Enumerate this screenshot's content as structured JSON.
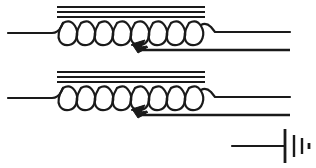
{
  "diagram": {
    "background_color": "#ffffff",
    "ink_color": "#1a1a1a",
    "width": 316,
    "height": 168,
    "components": [
      {
        "id": "inductor-1",
        "name": "tapped-iron-core-inductor-upper",
        "symbol": "inductor-with-core-and-wiper-tap",
        "loop_count": 8,
        "core_line_count": 3,
        "core": {
          "x1": 57,
          "x2": 205,
          "y_lines": [
            7,
            12,
            17
          ]
        },
        "coil": {
          "x_start": 60,
          "x_end": 205,
          "y_top": 22,
          "y_bottom": 45,
          "loops": 8
        },
        "lead_left": {
          "x1": 8,
          "y1": 33,
          "x2": 60,
          "y2": 22
        },
        "lead_right": {
          "x1": 205,
          "y1": 27,
          "x2": 290,
          "y2": 33
        },
        "tap": {
          "arrow_x": 140,
          "arrow_y": 45,
          "wire_x1": 140,
          "wire_y1": 50,
          "wire_x2": 290,
          "wire_y2": 50
        }
      },
      {
        "id": "inductor-2",
        "name": "tapped-iron-core-inductor-lower",
        "symbol": "inductor-with-core-and-wiper-tap",
        "loop_count": 8,
        "core_line_count": 3,
        "core": {
          "x1": 57,
          "x2": 205,
          "y_lines": [
            72,
            77,
            82
          ]
        },
        "coil": {
          "x_start": 60,
          "x_end": 205,
          "y_top": 87,
          "y_bottom": 110,
          "loops": 8
        },
        "lead_left": {
          "x1": 8,
          "y1": 98,
          "x2": 60,
          "y2": 87
        },
        "lead_right": {
          "x1": 205,
          "y1": 92,
          "x2": 290,
          "y2": 98
        },
        "tap": {
          "arrow_x": 140,
          "arrow_y": 110,
          "wire_x1": 140,
          "wire_y1": 115,
          "wire_x2": 290,
          "wire_y2": 115
        }
      },
      {
        "id": "battery-1",
        "name": "battery-cell-source",
        "symbol": "battery",
        "lead_left": {
          "x1": 232,
          "y1": 146,
          "x2": 285,
          "y2": 146
        },
        "plates": [
          {
            "x": 285,
            "half_height": 17,
            "thickness": 2.8
          },
          {
            "x": 294,
            "half_height": 11,
            "thickness": 2.4
          },
          {
            "x": 302,
            "half_height": 8,
            "thickness": 2.4
          },
          {
            "x": 309,
            "half_height": 3,
            "thickness": 2.6
          }
        ]
      }
    ],
    "labels": []
  }
}
